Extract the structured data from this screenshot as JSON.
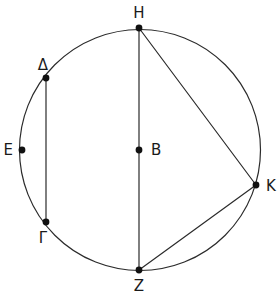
{
  "figure": {
    "width": 280,
    "height": 296,
    "background_color": "#ffffff",
    "stroke_color": "#2b2b2b",
    "point_color": "#111111",
    "label_color": "#1a1a1a",
    "circle_stroke_width": 1.2,
    "chord_stroke_width": 1.2,
    "point_radius": 3.4,
    "label_font_size": 15
  },
  "circle": {
    "name": "main-circle",
    "cx": 140,
    "cy": 150,
    "r": 120.5
  },
  "points": [
    {
      "id": "H",
      "label": "H",
      "cx": 139,
      "cy": 28,
      "label_x": 139,
      "label_y": 13,
      "anchor": "center",
      "role": "circumference"
    },
    {
      "id": "D",
      "label": "Δ",
      "cx": 46,
      "cy": 78,
      "label_x": 43,
      "label_y": 65,
      "anchor": "center",
      "role": "circumference"
    },
    {
      "id": "E",
      "label": "E",
      "cx": 22,
      "cy": 150,
      "label_x": 13,
      "label_y": 150,
      "anchor": "left",
      "role": "circumference"
    },
    {
      "id": "G",
      "label": "Γ",
      "cx": 46,
      "cy": 222,
      "label_x": 43,
      "label_y": 238,
      "anchor": "center",
      "role": "circumference"
    },
    {
      "id": "B",
      "label": "B",
      "cx": 139,
      "cy": 150,
      "label_x": 151,
      "label_y": 150,
      "anchor": "right",
      "role": "center"
    },
    {
      "id": "K",
      "label": "K",
      "cx": 256,
      "cy": 185,
      "label_x": 266,
      "label_y": 186,
      "anchor": "right",
      "role": "circumference"
    },
    {
      "id": "Z",
      "label": "Z",
      "cx": 139,
      "cy": 270,
      "label_x": 139,
      "label_y": 286,
      "anchor": "center",
      "role": "circumference"
    }
  ],
  "segments": [
    {
      "id": "DG",
      "name": "chord-delta-gamma",
      "x1": 46,
      "y1": 78,
      "x2": 46,
      "y2": 222
    },
    {
      "id": "HZ",
      "name": "diameter-eta-zeta",
      "x1": 139,
      "y1": 28,
      "x2": 139,
      "y2": 270
    },
    {
      "id": "HK",
      "name": "chord-eta-kappa",
      "x1": 139,
      "y1": 28,
      "x2": 256,
      "y2": 185
    },
    {
      "id": "ZK",
      "name": "chord-zeta-kappa",
      "x1": 139,
      "y1": 270,
      "x2": 256,
      "y2": 185
    }
  ]
}
